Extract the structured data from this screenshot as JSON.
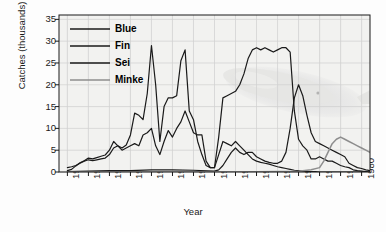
{
  "chart_data": {
    "type": "line",
    "title": "",
    "xlabel": "Year",
    "ylabel": "Catches (thousands)",
    "xlim": [
      1908,
      1982
    ],
    "ylim": [
      0,
      36
    ],
    "xticks": [
      1910,
      1915,
      1920,
      1925,
      1930,
      1935,
      1940,
      1945,
      1950,
      1955,
      1960,
      1965,
      1970,
      1975,
      1980
    ],
    "yticks": [
      0,
      5,
      10,
      15,
      20,
      25,
      30,
      35
    ],
    "grid": true,
    "legend_position": "top-left inside",
    "series": [
      {
        "name": "Blue",
        "color": "#1a1a1a",
        "x": [
          1910,
          1911,
          1912,
          1913,
          1914,
          1915,
          1916,
          1917,
          1918,
          1919,
          1920,
          1921,
          1922,
          1923,
          1924,
          1925,
          1926,
          1927,
          1928,
          1929,
          1930,
          1931,
          1932,
          1933,
          1934,
          1935,
          1936,
          1937,
          1938,
          1939,
          1940,
          1941,
          1942,
          1943,
          1944,
          1945,
          1946,
          1947,
          1948,
          1949,
          1950,
          1951,
          1952,
          1953,
          1954,
          1955,
          1956,
          1957,
          1958,
          1959,
          1960,
          1961,
          1962,
          1963,
          1964,
          1965,
          1966,
          1967,
          1968,
          1969,
          1970,
          1971,
          1972,
          1973,
          1974,
          1975,
          1976,
          1977,
          1978,
          1979,
          1980,
          1981,
          1982
        ],
        "y": [
          0.3,
          0.6,
          1.4,
          2.1,
          2.6,
          3.2,
          3.0,
          3.3,
          3.6,
          3.9,
          5.0,
          7.0,
          6.0,
          5.5,
          6.2,
          8.5,
          13.5,
          13.0,
          12.0,
          18.0,
          29.0,
          20.0,
          7.0,
          15.0,
          17.0,
          17.0,
          17.5,
          25.5,
          28.0,
          14.0,
          12.0,
          7.0,
          4.0,
          1.5,
          1.0,
          1.0,
          4.0,
          7.0,
          6.5,
          6.0,
          7.0,
          6.0,
          5.0,
          4.0,
          3.0,
          2.5,
          2.2,
          2.0,
          1.8,
          1.5,
          1.2,
          1.0,
          0.8,
          0.6,
          0.4,
          0.3,
          0.2,
          0.1,
          0.1,
          0.1,
          0.0,
          0.0,
          0.0,
          0.0,
          0.0,
          0.0,
          0.0,
          0.0,
          0.0,
          0.0,
          0.0,
          0.0,
          0.0
        ]
      },
      {
        "name": "Fin",
        "color": "#1a1a1a",
        "x": [
          1910,
          1911,
          1912,
          1913,
          1914,
          1915,
          1916,
          1917,
          1918,
          1919,
          1920,
          1921,
          1922,
          1923,
          1924,
          1925,
          1926,
          1927,
          1928,
          1929,
          1930,
          1931,
          1932,
          1933,
          1934,
          1935,
          1936,
          1937,
          1938,
          1939,
          1940,
          1941,
          1942,
          1943,
          1944,
          1945,
          1946,
          1947,
          1948,
          1949,
          1950,
          1951,
          1952,
          1953,
          1954,
          1955,
          1956,
          1957,
          1958,
          1959,
          1960,
          1961,
          1962,
          1963,
          1964,
          1965,
          1966,
          1967,
          1968,
          1969,
          1970,
          1971,
          1972,
          1973,
          1974,
          1975,
          1976,
          1977,
          1978,
          1979,
          1980,
          1981,
          1982
        ],
        "y": [
          1.0,
          1.2,
          1.5,
          2.0,
          2.5,
          2.8,
          2.6,
          2.8,
          3.0,
          3.2,
          4.0,
          5.5,
          6.0,
          5.0,
          5.5,
          6.0,
          6.5,
          6.0,
          8.5,
          9.0,
          10.0,
          6.0,
          4.0,
          7.0,
          9.5,
          8.0,
          10.0,
          11.5,
          14.0,
          11.5,
          9.0,
          8.5,
          8.5,
          2.5,
          1.0,
          1.0,
          8.0,
          17.0,
          17.5,
          18.0,
          18.5,
          20.0,
          22.5,
          26.0,
          28.0,
          28.5,
          28.0,
          28.5,
          28.0,
          27.5,
          28.0,
          28.5,
          28.5,
          27.5,
          14.0,
          7.5,
          6.0,
          5.0,
          3.0,
          3.0,
          3.5,
          3.0,
          2.5,
          2.5,
          2.0,
          1.5,
          1.2,
          1.0,
          0.5,
          0.3,
          0.2,
          0.1,
          0.0
        ]
      },
      {
        "name": "Sei",
        "color": "#1a1a1a",
        "x": [
          1910,
          1915,
          1920,
          1925,
          1930,
          1935,
          1940,
          1945,
          1946,
          1947,
          1948,
          1949,
          1950,
          1951,
          1952,
          1953,
          1954,
          1955,
          1956,
          1957,
          1958,
          1959,
          1960,
          1961,
          1962,
          1963,
          1964,
          1965,
          1966,
          1967,
          1968,
          1969,
          1970,
          1971,
          1972,
          1973,
          1974,
          1975,
          1976,
          1977,
          1978,
          1979,
          1980,
          1981,
          1982
        ],
        "y": [
          0.1,
          0.2,
          0.3,
          0.3,
          0.5,
          0.5,
          0.4,
          0.2,
          0.5,
          1.5,
          3.0,
          4.5,
          5.5,
          4.5,
          4.0,
          4.5,
          4.5,
          3.5,
          3.0,
          2.5,
          2.2,
          2.0,
          2.0,
          2.5,
          4.5,
          10.0,
          17.0,
          20.0,
          17.5,
          13.0,
          9.0,
          7.0,
          6.5,
          6.0,
          5.5,
          5.0,
          4.5,
          4.0,
          3.5,
          2.0,
          1.5,
          1.0,
          0.8,
          0.5,
          0.3
        ]
      },
      {
        "name": "Minke",
        "color": "#8e8e8e",
        "x": [
          1910,
          1920,
          1930,
          1940,
          1950,
          1960,
          1965,
          1968,
          1970,
          1971,
          1972,
          1973,
          1974,
          1975,
          1976,
          1977,
          1978,
          1979,
          1980,
          1981,
          1982
        ],
        "y": [
          0.0,
          0.0,
          0.0,
          0.0,
          0.0,
          0.1,
          0.2,
          0.5,
          1.0,
          2.5,
          4.5,
          6.5,
          7.5,
          8.0,
          7.5,
          7.0,
          6.5,
          6.0,
          5.5,
          5.0,
          4.5
        ]
      }
    ]
  },
  "legend": {
    "items": [
      {
        "label": "Blue",
        "color": "#1a1a1a"
      },
      {
        "label": "Fin",
        "color": "#1a1a1a"
      },
      {
        "label": "Sei",
        "color": "#1a1a1a"
      },
      {
        "label": "Minke",
        "color": "#8e8e8e"
      }
    ]
  },
  "axes": {
    "ylabel": "Catches (thousands)",
    "xlabel": "Year",
    "ytick_labels": [
      "0",
      "5",
      "10",
      "15",
      "20",
      "25",
      "30",
      "35"
    ],
    "xtick_labels": [
      "1910",
      "1915",
      "1920",
      "1925",
      "1930",
      "1935",
      "1940",
      "1945",
      "1950",
      "1955",
      "1960",
      "1965",
      "1970",
      "1975",
      "1980"
    ]
  },
  "watermark": {
    "name": "whale-illustration",
    "description": "faint grayscale whale image"
  },
  "colors": {
    "axis": "#1a1a1a",
    "grid": "#c9c9c9",
    "plot_background": "#f2f2f0",
    "minke_line": "#8e8e8e",
    "main_line": "#1a1a1a"
  }
}
